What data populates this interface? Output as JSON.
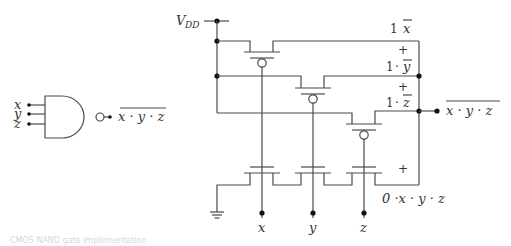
{
  "gate_symbol": {
    "type": "NAND3",
    "inputs": [
      "x",
      "y",
      "z"
    ],
    "output_expr": "x · y · z",
    "output_overbar": true
  },
  "cmos_circuit": {
    "supply_label": "V",
    "supply_subscript": "DD",
    "pmos_terms": [
      {
        "coef": "1",
        "dot": "",
        "var": "x",
        "overbar": true,
        "plus": ""
      },
      {
        "coef": "1",
        "dot": "·",
        "var": "y",
        "overbar": true,
        "plus": "+"
      },
      {
        "coef": "1",
        "dot": "·",
        "var": "z",
        "overbar": true,
        "plus": "+"
      }
    ],
    "nmos_plus": "+",
    "nmos_term": "0 ·x · y · z",
    "output_expr": "x · y · z",
    "output_overbar": true,
    "gate_inputs": [
      "x",
      "y",
      "z"
    ]
  },
  "caption": "CMOS NAND gate implementation"
}
